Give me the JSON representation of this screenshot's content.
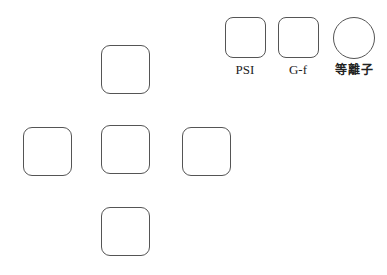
{
  "dpad": {
    "up": {
      "label": ""
    },
    "left": {
      "label": ""
    },
    "center": {
      "label": ""
    },
    "right": {
      "label": ""
    },
    "down": {
      "label": ""
    }
  },
  "function_keys": [
    {
      "label": "PSI",
      "shape": "rounded-square"
    },
    {
      "label": "G-f",
      "shape": "rounded-square"
    },
    {
      "label": "等離子",
      "shape": "circle"
    }
  ],
  "colors": {
    "border": "#555555",
    "background": "#ffffff",
    "text": "#222222"
  }
}
